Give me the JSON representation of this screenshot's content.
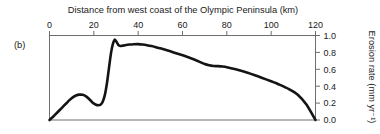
{
  "panel": {
    "label": "(b)"
  },
  "chart_data": {
    "type": "line",
    "title": "Distance from west coast of the Olympic Peninsula (km)",
    "xlabel": "Distance from west coast of the Olympic Peninsula (km)",
    "ylabel": "Erosion rate (mm yr⁻¹)",
    "xlim": [
      0,
      120
    ],
    "ylim": [
      0.0,
      1.0
    ],
    "xticks": [
      0,
      20,
      40,
      60,
      80,
      100,
      120
    ],
    "xtick_labels": [
      "0",
      "20",
      "40",
      "60",
      "80",
      "100",
      "120"
    ],
    "yticks": [
      0.0,
      0.2,
      0.4,
      0.6,
      0.8,
      1.0
    ],
    "ytick_labels": [
      "0.0",
      "0.2",
      "0.4",
      "0.6",
      "0.8",
      "1.0"
    ],
    "x_axis_position": "top",
    "y_axis_position": "right",
    "grid": false,
    "legend": null,
    "series": [
      {
        "name": "Erosion rate",
        "color": "#141414",
        "x": [
          0,
          1.5,
          3,
          4.5,
          6,
          7.5,
          9,
          10.5,
          12,
          13.5,
          15,
          16.5,
          18,
          19.5,
          21,
          22,
          23,
          24,
          25,
          26,
          27,
          27.8,
          28.6,
          29.4,
          30,
          31,
          32,
          33,
          34.5,
          36,
          38,
          40,
          42,
          44,
          46,
          48,
          50,
          53,
          56,
          59,
          62,
          65,
          68,
          70,
          72,
          74,
          76,
          78,
          80,
          84,
          88,
          92,
          96,
          100,
          104,
          108,
          112,
          116,
          120
        ],
        "y": [
          0.0,
          0.035,
          0.075,
          0.115,
          0.155,
          0.195,
          0.235,
          0.268,
          0.29,
          0.3,
          0.298,
          0.28,
          0.245,
          0.205,
          0.18,
          0.175,
          0.18,
          0.215,
          0.3,
          0.45,
          0.65,
          0.8,
          0.9,
          0.95,
          0.935,
          0.89,
          0.875,
          0.88,
          0.888,
          0.893,
          0.897,
          0.898,
          0.893,
          0.885,
          0.875,
          0.862,
          0.848,
          0.825,
          0.8,
          0.775,
          0.748,
          0.718,
          0.685,
          0.662,
          0.648,
          0.64,
          0.637,
          0.633,
          0.625,
          0.6,
          0.57,
          0.535,
          0.498,
          0.458,
          0.415,
          0.365,
          0.3,
          0.18,
          0.0
        ]
      }
    ]
  }
}
